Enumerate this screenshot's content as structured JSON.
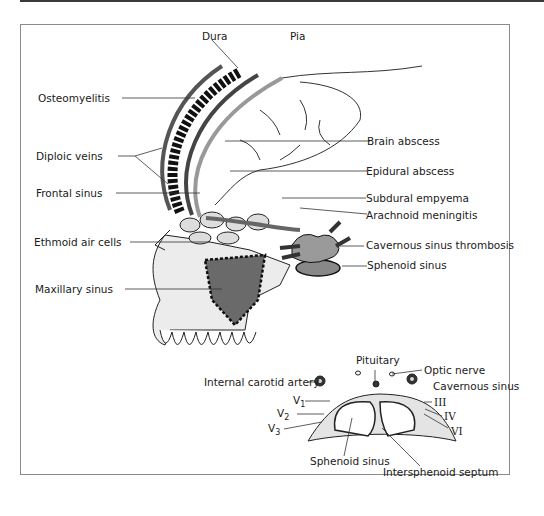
{
  "figure": {
    "top_labels": {
      "dura": "Dura",
      "pia": "Pia"
    },
    "left_labels": {
      "osteomyelitis": "Osteomyelitis",
      "diploic_veins": "Diploic veins",
      "frontal_sinus": "Frontal sinus",
      "ethmoid_air_cells": "Ethmoid air cells",
      "maxillary_sinus": "Maxillary sinus"
    },
    "right_labels": {
      "brain_abscess": "Brain abscess",
      "epidural_abscess": "Epidural abscess",
      "subdural_empyema": "Subdural empyema",
      "arachnoid_meningitis": "Arachnoid meningitis",
      "cavernous_sinus_thrombosis": "Cavernous sinus thrombosis",
      "sphenoid_sinus": "Sphenoid sinus"
    },
    "inset": {
      "pituitary": "Pituitary",
      "optic_nerve": "Optic nerve",
      "cavernous_sinus": "Cavernous sinus",
      "internal_carotid_artery": "Internal carotid artery",
      "v1": "V",
      "v1_sub": "1",
      "v2": "V",
      "v2_sub": "2",
      "v3": "V",
      "v3_sub": "3",
      "cn_iii": "III",
      "cn_iv": "IV",
      "cn_vi": "VI",
      "sphenoid_sinus": "Sphenoid sinus",
      "intersphenoid_septum": "Intersphenoid septum"
    }
  }
}
